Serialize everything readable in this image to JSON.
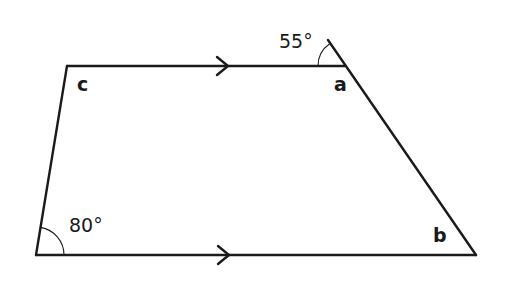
{
  "diagram": {
    "type": "trapezium",
    "stroke_color": "#1a1a1a",
    "vertices": {
      "top_left": [
        67,
        66
      ],
      "a": [
        345,
        66
      ],
      "b": [
        476,
        255
      ],
      "bottom_left": [
        36,
        255
      ],
      "extension_end": [
        328,
        40
      ]
    },
    "labels": {
      "c": "c",
      "a": "a",
      "b": "b",
      "angle_top": "55°",
      "angle_bottom_left": "80°"
    },
    "parallel_markers": [
      "top-edge-arrow",
      "bottom-edge-arrow"
    ]
  }
}
